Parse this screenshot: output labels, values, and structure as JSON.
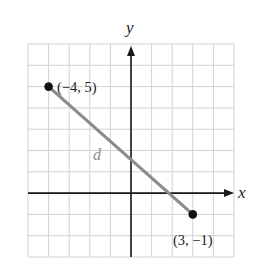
{
  "chart_data": {
    "type": "scatter",
    "title": "",
    "xlabel": "x",
    "ylabel": "y",
    "xlim": [
      -5,
      5
    ],
    "ylim": [
      -3,
      7
    ],
    "grid": true,
    "grid_step": 1,
    "tick_labels_shown": false,
    "series": [
      {
        "name": "segment d",
        "kind": "line-segment",
        "points": [
          {
            "x": -4,
            "y": 5,
            "label": "(−4, 5)"
          },
          {
            "x": 3,
            "y": -1,
            "label": "(3, −1)"
          }
        ],
        "segment_label": "d"
      }
    ],
    "colors": {
      "grid": "#d2d2d2",
      "axis": "#1a1a1a",
      "segment": "#8c8c8c",
      "point": "#111111",
      "segment_label": "#8a8a8a"
    }
  },
  "labels": {
    "x_axis": "x",
    "y_axis": "y",
    "point_a": "(−4, 5)",
    "point_b": "(3, −1)",
    "segment": "d"
  }
}
